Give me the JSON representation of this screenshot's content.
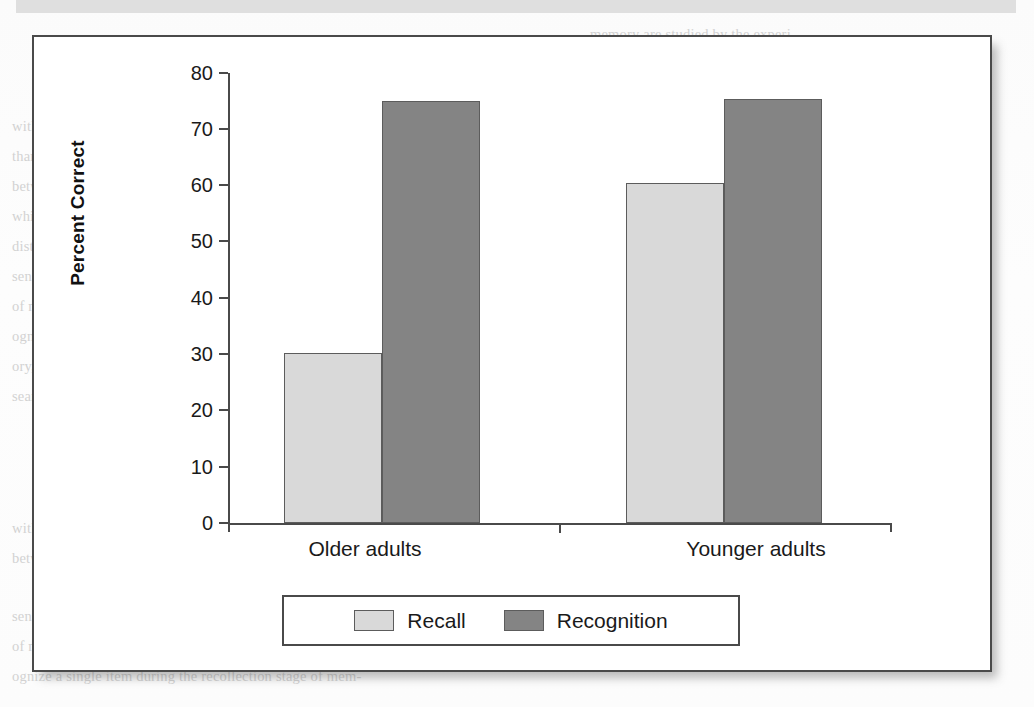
{
  "figure": {
    "border_color": "#4a4a4a",
    "background": "#ffffff"
  },
  "chart_data": {
    "type": "bar",
    "title": "",
    "xlabel": "",
    "ylabel": "Percent Correct",
    "categories": [
      "Older adults",
      "Younger adults"
    ],
    "series": [
      {
        "name": "Recall",
        "color": "#d9d9d9",
        "values": [
          30.2,
          60.5
        ]
      },
      {
        "name": "Recognition",
        "color": "#848484",
        "values": [
          75.0,
          75.4
        ]
      }
    ],
    "ylim": [
      0,
      80
    ],
    "yticks": [
      0,
      10,
      20,
      30,
      40,
      50,
      60,
      70,
      80
    ],
    "ytick_labels": [
      "0",
      "10",
      "20",
      "30",
      "40",
      "50",
      "60",
      "70",
      "80"
    ],
    "grid": false,
    "legend_position": "bottom"
  },
  "legend": {
    "entries": [
      {
        "label": "Recall",
        "swatch": "recall"
      },
      {
        "label": "Recognition",
        "swatch": "recognition"
      }
    ]
  },
  "page_ghost_text": {
    "head_right": "Recall Versus Recognition in Episodic",
    "lines": [
      "memory are studied by the experi-",
      "menter is different, usually more",
      "demanding, than that encountered",
      "with recognition. For it is likely that these are much more",
      "than the typical recall task, even though it does require",
      "between two alternative cues and which is not to be recall",
      "while recognition requires that one distinguish a target from",
      "distractors. Recognition and recall are seen to differ in the",
      "sense that recognition always involves a test item",
      "of memory and retrieval, as the person is being asked to rec-",
      "ognize a single item during the recollection stage of mem-",
      "ory, whereas the recall stage requires that the material be",
      "searched and something must be produced."
    ]
  }
}
